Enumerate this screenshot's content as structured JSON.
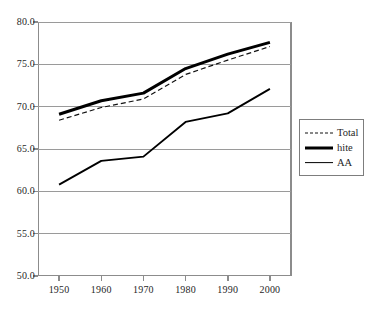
{
  "chart_data": {
    "type": "line",
    "title": "",
    "subtitle": "",
    "xlabel": "",
    "ylabel": "",
    "x": [
      1950,
      1960,
      1970,
      1980,
      1990,
      2000
    ],
    "categories": [
      "1950",
      "1960",
      "1970",
      "1980",
      "1990",
      "2000"
    ],
    "xlim": [
      1945,
      2005
    ],
    "ylim": [
      50.0,
      80.0
    ],
    "y_ticks": [
      "50.0",
      "55.0",
      "60.0",
      "65.0",
      "70.0",
      "75.0",
      "80.0"
    ],
    "y_tick_values": [
      50.0,
      55.0,
      60.0,
      65.0,
      70.0,
      75.0,
      80.0
    ],
    "grid": "horizontal",
    "legend_position": "right-outside",
    "series": [
      {
        "name": "Total",
        "style": "dashed",
        "color": "#111111",
        "values": [
          68.4,
          69.9,
          70.9,
          73.8,
          75.5,
          77.1
        ]
      },
      {
        "name": "hite",
        "style": "thick-solid",
        "color": "#000000",
        "values": [
          69.1,
          70.7,
          71.6,
          74.5,
          76.2,
          77.6
        ]
      },
      {
        "name": "AA",
        "style": "solid",
        "color": "#000000",
        "values": [
          60.8,
          63.6,
          64.1,
          68.2,
          69.2,
          72.1
        ]
      }
    ]
  },
  "legend": {
    "entries": [
      {
        "label": "Total"
      },
      {
        "label": "hite"
      },
      {
        "label": "AA"
      }
    ]
  },
  "colors": {
    "axis": "#8c8c8c",
    "gridline": "#9a9a9a",
    "series": "#000000",
    "background": "#ffffff"
  }
}
